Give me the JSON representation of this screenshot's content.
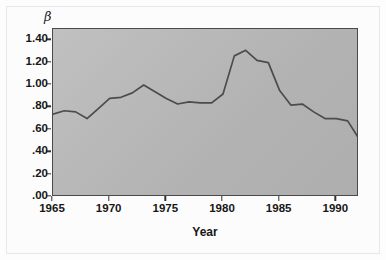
{
  "figure": {
    "background_color": "#fdfdfd",
    "plot_background_color": "#b9b9b9",
    "frame_color": "#4a4a4a",
    "line_color": "#4c4c4c"
  },
  "axis": {
    "y_symbol": "β",
    "x_title": "Year",
    "y_tick_labels": [
      "1.40",
      "1.20",
      "1.00",
      ".80",
      ".60",
      ".40",
      ".20",
      ".00"
    ],
    "y_tick_values": [
      1.4,
      1.2,
      1.0,
      0.8,
      0.6,
      0.4,
      0.2,
      0.0
    ],
    "x_tick_labels": [
      "1965",
      "1970",
      "1975",
      "1980",
      "1985",
      "1990"
    ],
    "x_tick_values": [
      1965,
      1970,
      1975,
      1980,
      1985,
      1990
    ]
  },
  "chart_data": {
    "type": "line",
    "title": "",
    "xlabel": "Year",
    "ylabel": "β",
    "xlim": [
      1965,
      1992
    ],
    "ylim": [
      0.0,
      1.5
    ],
    "grid": false,
    "legend": "none",
    "x": [
      1965,
      1966,
      1967,
      1968,
      1969,
      1970,
      1971,
      1972,
      1973,
      1974,
      1975,
      1976,
      1977,
      1978,
      1979,
      1980,
      1981,
      1982,
      1983,
      1984,
      1985,
      1986,
      1987,
      1988,
      1989,
      1990,
      1991,
      1992
    ],
    "values": [
      0.74,
      0.77,
      0.76,
      0.7,
      0.79,
      0.88,
      0.89,
      0.93,
      1.0,
      0.94,
      0.88,
      0.83,
      0.85,
      0.84,
      0.84,
      0.92,
      1.26,
      1.31,
      1.22,
      1.2,
      0.95,
      0.82,
      0.83,
      0.76,
      0.7,
      0.7,
      0.68,
      0.52
    ],
    "series": [
      {
        "name": "β",
        "values": [
          0.74,
          0.77,
          0.76,
          0.7,
          0.79,
          0.88,
          0.89,
          0.93,
          1.0,
          0.94,
          0.88,
          0.83,
          0.85,
          0.84,
          0.84,
          0.92,
          1.26,
          1.31,
          1.22,
          1.2,
          0.95,
          0.82,
          0.83,
          0.76,
          0.7,
          0.7,
          0.68,
          0.52
        ]
      }
    ]
  }
}
